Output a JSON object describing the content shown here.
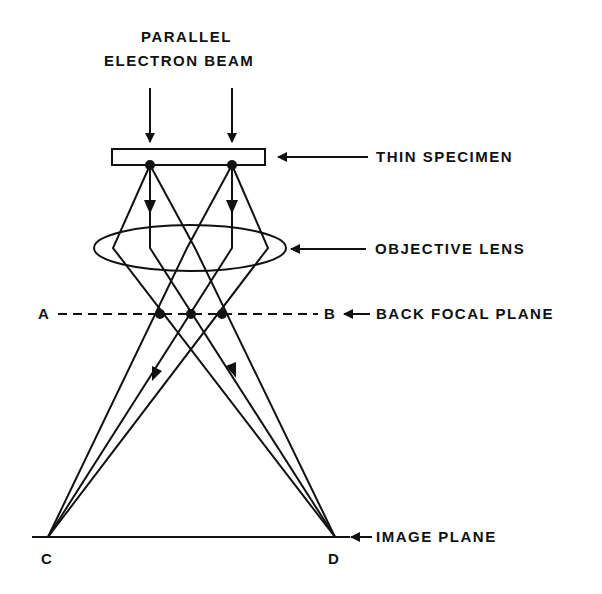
{
  "diagram": {
    "beam_label_line1": "PARALLEL",
    "beam_label_line2": "ELECTRON BEAM",
    "labels": {
      "specimen": "THIN SPECIMEN",
      "lens": "OBJECTIVE LENS",
      "bfp": "BACK FOCAL PLANE",
      "image_plane": "IMAGE PLANE"
    },
    "points": {
      "a": "A",
      "b": "B",
      "c": "C",
      "d": "D"
    },
    "ink_color": "#111111",
    "background": "#ffffff"
  }
}
